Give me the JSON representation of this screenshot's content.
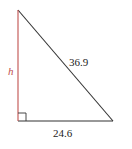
{
  "diagram": {
    "type": "right-triangle",
    "vertices": {
      "top": [
        18,
        10
      ],
      "right_angle": [
        18,
        121
      ],
      "bottom_right": [
        113,
        121
      ]
    },
    "sides": {
      "height": {
        "label": "h",
        "color": "#c0504d"
      },
      "hypotenuse": {
        "label": "36.9",
        "color": "#333333"
      },
      "base": {
        "label": "24.6",
        "color": "#333333"
      }
    },
    "right_angle_marker": {
      "size": 8
    }
  }
}
